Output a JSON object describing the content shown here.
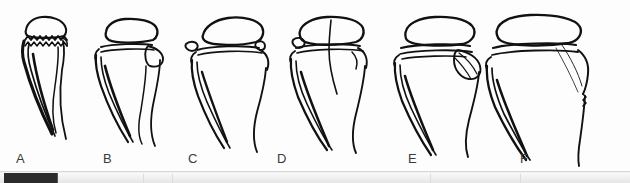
{
  "figure": {
    "background_color": "#fdfdfd",
    "ink_color": "#111111",
    "panels": [
      {
        "id": "A",
        "label": "A",
        "label_x": 16,
        "label_y": 152,
        "caption": "A",
        "name": "panel-a"
      },
      {
        "id": "B",
        "label": "B",
        "label_x": 103,
        "label_y": 152,
        "caption": "B",
        "name": "panel-b"
      },
      {
        "id": "C",
        "label": "C",
        "label_x": 188,
        "label_y": 152,
        "caption": "C",
        "name": "panel-c"
      },
      {
        "id": "D",
        "label": "D",
        "label_x": 277,
        "label_y": 152,
        "caption": "D",
        "name": "panel-d"
      },
      {
        "id": "E",
        "label": "E",
        "label_x": 408,
        "label_y": 152,
        "caption": "E",
        "name": "panel-e"
      },
      {
        "id": "F",
        "label": "F",
        "label_x": 520,
        "label_y": 152,
        "caption": "F",
        "name": "panel-f"
      }
    ]
  },
  "scrollbar": {
    "orientation": "horizontal",
    "thumb_left_px": 4,
    "thumb_width_px": 53,
    "track_width_px": 630,
    "thumb_color": "#2b2b2b",
    "track_color": "#ededed",
    "position_label": "0%"
  }
}
